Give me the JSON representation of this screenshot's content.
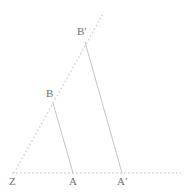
{
  "figure": {
    "kind": "geometry-diagram",
    "width": 192,
    "height": 194,
    "background_color": "#ffffff",
    "colors": {
      "solid_line": "#c5c5ca",
      "dotted_line": "#d2d2d7",
      "label_text": "#6f6f6f"
    },
    "points": [
      {
        "name": "Z",
        "label": "Z",
        "x": 14,
        "y": 173,
        "label_x": 9,
        "label_y": 176
      },
      {
        "name": "A",
        "label": "A",
        "x": 73,
        "y": 173,
        "label_x": 69,
        "label_y": 176
      },
      {
        "name": "Aprime",
        "label": "A'",
        "x": 122,
        "y": 173,
        "label_x": 117,
        "label_y": 176
      },
      {
        "name": "B",
        "label": "B",
        "x": 53,
        "y": 103,
        "label_x": 46,
        "label_y": 88
      },
      {
        "name": "Bprime",
        "label": "B'",
        "x": 85,
        "y": 42,
        "label_x": 77,
        "label_y": 26
      }
    ],
    "segments": [
      {
        "name": "segment-B-A",
        "from": "B",
        "to": "A",
        "style": "solid",
        "color": "#c5c5ca"
      },
      {
        "name": "segment-Bp-Ap",
        "from": "Bprime",
        "to": "Aprime",
        "style": "solid",
        "color": "#c5c5ca"
      }
    ],
    "rays": [
      {
        "name": "baseline-ray-Z-A-Aprime",
        "style": "dotted",
        "color": "#d2d2d7",
        "x1": 12,
        "y1": 173,
        "x2": 181,
        "y2": 173
      },
      {
        "name": "ray-Z-through-B-Bprime",
        "style": "dotted",
        "color": "#d2d2d7",
        "x1": 14,
        "y1": 173,
        "x2": 104,
        "y2": 12
      }
    ]
  }
}
